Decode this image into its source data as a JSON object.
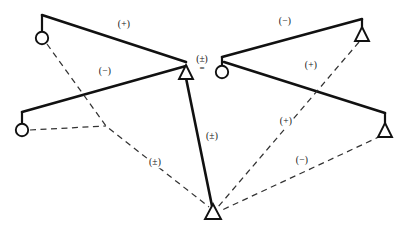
{
  "figure": {
    "width": 409,
    "height": 231,
    "background_color": "#ffffff",
    "ink_color": "#111111",
    "equals_symbol": "=",
    "center_annotation": {
      "sign_label": "(±)",
      "relation": "="
    }
  },
  "legend_semantics": {
    "solid_edge": "strong-tie",
    "dashed_edge": "weak-tie",
    "circle_node": "open-circle-actor",
    "triangle_node": "open-triangle-actor",
    "positive": "(+)",
    "negative": "(−)",
    "ambiguous": "(±)"
  },
  "nodes": [
    {
      "id": "L1",
      "shape": "circle",
      "cx": 42,
      "cy": 38,
      "stem_to_y": 15,
      "side": "left"
    },
    {
      "id": "L2",
      "shape": "circle",
      "cx": 22,
      "cy": 130,
      "stem_to_y": 112,
      "side": "left"
    },
    {
      "id": "L3",
      "shape": "triangle",
      "cx": 186,
      "cy": 74,
      "stem_to_y": 61,
      "side": "left"
    },
    {
      "id": "C",
      "shape": "triangle",
      "cx": 213,
      "cy": 213,
      "stem_to_y": 213,
      "side": "shared"
    },
    {
      "id": "R1",
      "shape": "circle",
      "cx": 222,
      "cy": 72,
      "stem_to_y": 57,
      "side": "right"
    },
    {
      "id": "R2",
      "shape": "triangle",
      "cx": 362,
      "cy": 34,
      "stem_to_y": 19,
      "side": "right"
    },
    {
      "id": "R3",
      "shape": "triangle",
      "cx": 385,
      "cy": 130,
      "stem_to_y": 113,
      "side": "right"
    }
  ],
  "edges": [
    {
      "id": "e1",
      "from": "L1",
      "to": "L3",
      "style": "solid",
      "sign": "(+)",
      "label_x": 124,
      "label_y": 25
    },
    {
      "id": "e2",
      "from": "L2",
      "to": "L3",
      "style": "solid",
      "sign": "(−)",
      "label_x": 105,
      "label_y": 72
    },
    {
      "id": "e3",
      "from": "L1",
      "to": "C",
      "style": "dashed",
      "sign": "(±)",
      "label_x": 155,
      "label_y": 163
    },
    {
      "id": "e4",
      "from": "L3",
      "to": "C",
      "style": "solid",
      "sign": "(±)",
      "label_x": 212,
      "label_y": 137
    },
    {
      "id": "e5",
      "from": "R1",
      "to": "R2",
      "style": "solid",
      "sign": "(−)",
      "label_x": 285,
      "label_y": 22
    },
    {
      "id": "e6",
      "from": "R1",
      "to": "R3",
      "style": "solid",
      "sign": "(+)",
      "label_x": 311,
      "label_y": 66
    },
    {
      "id": "e7",
      "from": "R2",
      "to": "C",
      "style": "dashed",
      "sign": "(+)",
      "label_x": 286,
      "label_y": 122
    },
    {
      "id": "e8",
      "from": "R3",
      "to": "C",
      "style": "dashed",
      "sign": "(−)",
      "label_x": 302,
      "label_y": 161
    }
  ],
  "labels": {
    "e1": "(+)",
    "e2": "(−)",
    "e3": "(±)",
    "e4": "(±)",
    "e5": "(−)",
    "e6": "(+)",
    "e7": "(+)",
    "e8": "(−)"
  }
}
